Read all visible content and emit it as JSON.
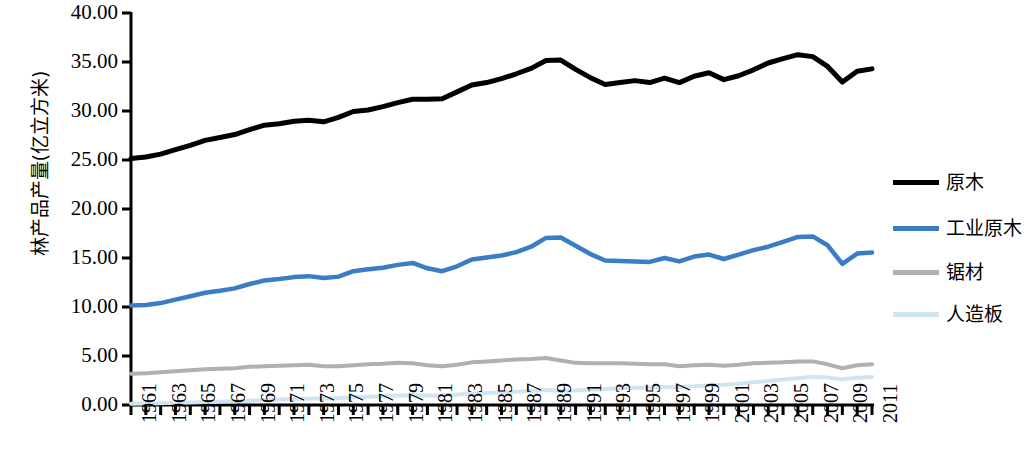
{
  "chart_data": {
    "type": "line",
    "title": "",
    "xlabel": "",
    "ylabel": "林产品产量(亿立方米)",
    "xlim": [
      1961,
      2011
    ],
    "ylim": [
      0.0,
      40.0
    ],
    "ytick_labels": [
      "40.00",
      "35.00",
      "30.00",
      "25.00",
      "20.00",
      "15.00",
      "10.00",
      "5.00",
      "0.00"
    ],
    "ytick_values": [
      40,
      35,
      30,
      25,
      20,
      15,
      10,
      5,
      0
    ],
    "grid": false,
    "legend_position": "right",
    "x": [
      1961,
      1962,
      1963,
      1964,
      1965,
      1966,
      1967,
      1968,
      1969,
      1970,
      1971,
      1972,
      1973,
      1974,
      1975,
      1976,
      1977,
      1978,
      1979,
      1980,
      1981,
      1982,
      1983,
      1984,
      1985,
      1986,
      1987,
      1988,
      1989,
      1990,
      1991,
      1992,
      1993,
      1994,
      1995,
      1996,
      1997,
      1998,
      1999,
      2000,
      2001,
      2002,
      2003,
      2004,
      2005,
      2006,
      2007,
      2008,
      2009,
      2010,
      2011
    ],
    "xtick_labels": [
      "1961",
      "1963",
      "1965",
      "1967",
      "1969",
      "1971",
      "1973",
      "1975",
      "1977",
      "1979",
      "1981",
      "1983",
      "1985",
      "1987",
      "1989",
      "1991",
      "1993",
      "1995",
      "1997",
      "1999",
      "2001",
      "2003",
      "2005",
      "2007",
      "2009",
      "2011"
    ],
    "series": [
      {
        "name": "原木",
        "color": "#000000",
        "width": 5.0,
        "values": [
          25.15,
          25.3,
          25.6,
          26.05,
          26.5,
          27.0,
          27.3,
          27.6,
          28.1,
          28.55,
          28.7,
          28.95,
          29.05,
          28.9,
          29.35,
          29.95,
          30.1,
          30.45,
          30.85,
          31.2,
          31.2,
          31.25,
          31.95,
          32.65,
          32.9,
          33.3,
          33.8,
          34.35,
          35.15,
          35.2,
          34.25,
          33.4,
          32.7,
          32.9,
          33.1,
          32.9,
          33.35,
          32.9,
          33.55,
          33.9,
          33.2,
          33.6,
          34.2,
          34.9,
          35.35,
          35.75,
          35.55,
          34.55,
          32.95,
          34.05,
          34.3
        ]
      },
      {
        "name": "工业原木",
        "color": "#3a7dc4",
        "width": 4.5,
        "values": [
          10.15,
          10.2,
          10.4,
          10.75,
          11.1,
          11.45,
          11.65,
          11.9,
          12.35,
          12.7,
          12.85,
          13.05,
          13.15,
          12.95,
          13.1,
          13.65,
          13.85,
          14.0,
          14.3,
          14.5,
          13.95,
          13.65,
          14.15,
          14.85,
          15.05,
          15.25,
          15.6,
          16.15,
          17.05,
          17.1,
          16.25,
          15.4,
          14.75,
          14.7,
          14.65,
          14.6,
          15.0,
          14.65,
          15.15,
          15.35,
          14.9,
          15.35,
          15.8,
          16.15,
          16.65,
          17.15,
          17.2,
          16.3,
          14.4,
          15.45,
          15.55
        ]
      },
      {
        "name": "锯材",
        "color": "#b0b0b0",
        "width": 4.0,
        "values": [
          3.2,
          3.25,
          3.35,
          3.45,
          3.55,
          3.65,
          3.7,
          3.75,
          3.9,
          3.95,
          4.0,
          4.05,
          4.1,
          3.95,
          3.95,
          4.05,
          4.15,
          4.2,
          4.3,
          4.25,
          4.05,
          3.95,
          4.1,
          4.35,
          4.45,
          4.55,
          4.65,
          4.7,
          4.8,
          4.55,
          4.3,
          4.25,
          4.25,
          4.25,
          4.2,
          4.15,
          4.15,
          3.95,
          4.05,
          4.1,
          4.0,
          4.1,
          4.25,
          4.3,
          4.35,
          4.45,
          4.45,
          4.15,
          3.75,
          4.05,
          4.15
        ]
      },
      {
        "name": "人造板",
        "color": "#cfe6f2",
        "width": 4.0,
        "values": [
          0.12,
          0.15,
          0.18,
          0.22,
          0.26,
          0.3,
          0.34,
          0.38,
          0.44,
          0.5,
          0.55,
          0.6,
          0.66,
          0.66,
          0.7,
          0.78,
          0.85,
          0.9,
          0.96,
          1.0,
          0.98,
          1.0,
          1.06,
          1.16,
          1.22,
          1.28,
          1.36,
          1.44,
          1.52,
          1.46,
          1.48,
          1.55,
          1.62,
          1.7,
          1.76,
          1.78,
          1.84,
          1.82,
          1.92,
          2.02,
          2.06,
          2.18,
          2.32,
          2.46,
          2.6,
          2.74,
          2.88,
          2.8,
          2.62,
          2.78,
          2.86
        ]
      }
    ]
  },
  "axis": {
    "y_label": "林产品产量(亿立方米)",
    "axis_color": "#000000"
  },
  "legend": {
    "items": [
      {
        "label": "原木",
        "color": "#000000",
        "width": 5
      },
      {
        "label": "工业原木",
        "color": "#3a7dc4",
        "width": 5
      },
      {
        "label": "锯材",
        "color": "#b0b0b0",
        "width": 5
      },
      {
        "label": "人造板",
        "color": "#cfe6f2",
        "width": 5
      }
    ]
  }
}
